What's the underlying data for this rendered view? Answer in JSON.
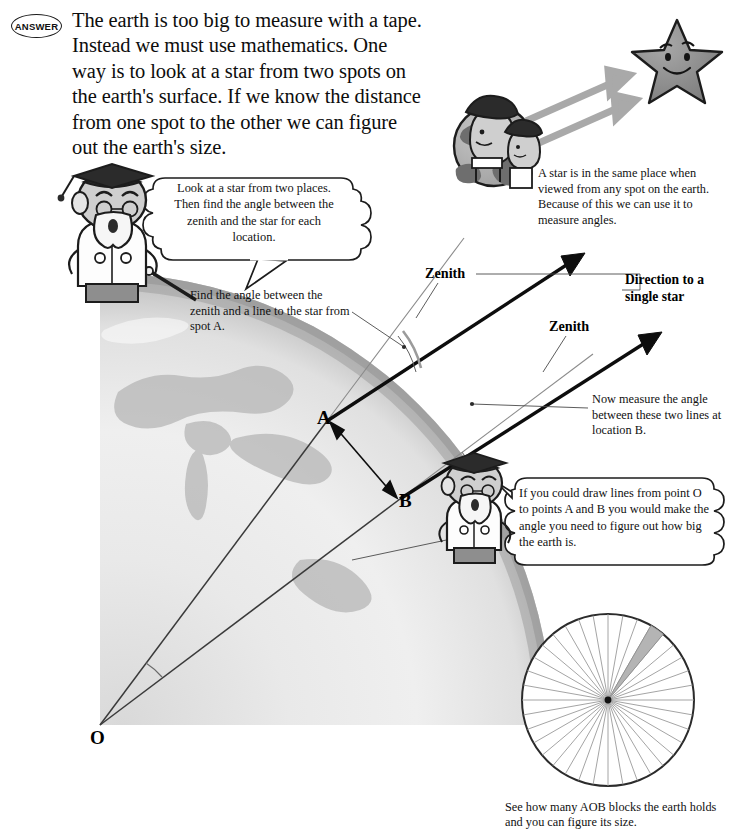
{
  "badge": {
    "label": "ANSWER"
  },
  "intro": {
    "text": "The earth is too big to measure with a tape. Instead we must use mathematics. One way is to look at a star from two spots on the earth's surface. If we know the distance from one spot to the other we can figure out the earth's size."
  },
  "bubbles": [
    {
      "id": "scholar-left-bubble",
      "text": "Look at a star from two places. Then find the angle between the zenith and the star for each location."
    },
    {
      "id": "scholar-right-bubble",
      "text": "If you could draw lines from point O to points A and B you would make the angle you need to figure out how big the earth is."
    }
  ],
  "notes": {
    "star_same_place": "A star is in the same place when viewed from any spot on the earth. Because of this we can use it to measure angles.",
    "find_angle_a": "Find the angle between the zenith and a line to the star from spot A.",
    "measure_angle_b": "Now measure the angle between these two lines at location B.",
    "aob_blocks": "See how many AOB blocks the earth holds and you can figure its size."
  },
  "labels": {
    "zenith_a": "Zenith",
    "zenith_b": "Zenith",
    "direction_star": "Direction to a single star",
    "point_a": "A",
    "point_b": "B",
    "point_o": "O"
  },
  "icons": {
    "star": "smiling-star-icon",
    "globe_small": "small-globe-with-people-icon",
    "scholar_left": "scholar-with-pointer-icon",
    "scholar_right": "scholar-icon",
    "earth_quadrant": "earth-quadrant-icon",
    "angle_wheel": "angle-wheel-icon"
  },
  "colors": {
    "ink": "#111111",
    "star_fill": "#8d8d8d",
    "globe_land": "#6f6f6f",
    "globe_sea": "#b9b9b9",
    "earth_light": "#f2f2f2",
    "earth_mid": "#d6d6d6",
    "earth_dark": "#9a9a9a",
    "wheel_sector": "#b4b4b4",
    "arrow_gray": "#a9a9a9"
  },
  "chart_data": {
    "type": "pie",
    "categories": [
      "AOB block",
      "remaining earth"
    ],
    "values": [
      1,
      35
    ],
    "segments": 36,
    "highlighted_index": 3,
    "highlight_color": "#b4b4b4",
    "legend": "none",
    "grid": false
  },
  "geometry": {
    "center_o": {
      "x": 100,
      "y": 725,
      "label": "O"
    },
    "point_a": {
      "x": 327,
      "y": 421,
      "label": "A"
    },
    "point_b": {
      "x": 400,
      "y": 499,
      "label": "B"
    },
    "earth_radius": 452,
    "zenith_angle_marked_at": "A",
    "measured_angle_marked_at": "B"
  }
}
